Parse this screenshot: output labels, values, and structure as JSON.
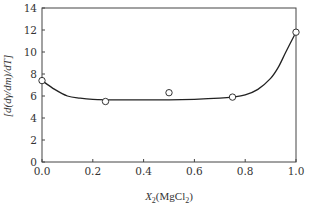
{
  "chart_data": {
    "type": "line",
    "title": "",
    "xlabel": "X2(MgCl2)",
    "xlabel_parts": {
      "var": "X",
      "sub": "2",
      "open": "(MgCl",
      "sub2": "2",
      "close": ")"
    },
    "ylabel": "[d(dγ/dm)/dT]",
    "xlim": [
      0.0,
      1.0
    ],
    "ylim": [
      0,
      14
    ],
    "x_ticks": [
      0.0,
      0.2,
      0.4,
      0.6,
      0.8,
      1.0
    ],
    "x_tick_labels": [
      "0.0",
      "0.2",
      "0.4",
      "0.6",
      "0.8",
      "1.0"
    ],
    "y_ticks": [
      0,
      2,
      4,
      6,
      8,
      10,
      12,
      14
    ],
    "y_tick_labels": [
      "0",
      "2",
      "4",
      "6",
      "8",
      "10",
      "12",
      "14"
    ],
    "grid": false,
    "series": [
      {
        "name": "experimental",
        "marker": "open-circle",
        "x": [
          0.0,
          0.25,
          0.5,
          0.75,
          1.0
        ],
        "y": [
          7.4,
          5.5,
          6.3,
          5.9,
          11.8
        ]
      },
      {
        "name": "fit-curve",
        "marker": "none",
        "x": [
          0.0,
          0.05,
          0.1,
          0.15,
          0.2,
          0.3,
          0.4,
          0.5,
          0.6,
          0.7,
          0.75,
          0.8,
          0.85,
          0.9,
          0.93,
          0.96,
          1.0
        ],
        "y": [
          7.4,
          6.6,
          6.0,
          5.8,
          5.7,
          5.65,
          5.65,
          5.65,
          5.7,
          5.8,
          5.9,
          6.1,
          6.6,
          7.6,
          8.6,
          10.0,
          11.8
        ]
      }
    ]
  }
}
